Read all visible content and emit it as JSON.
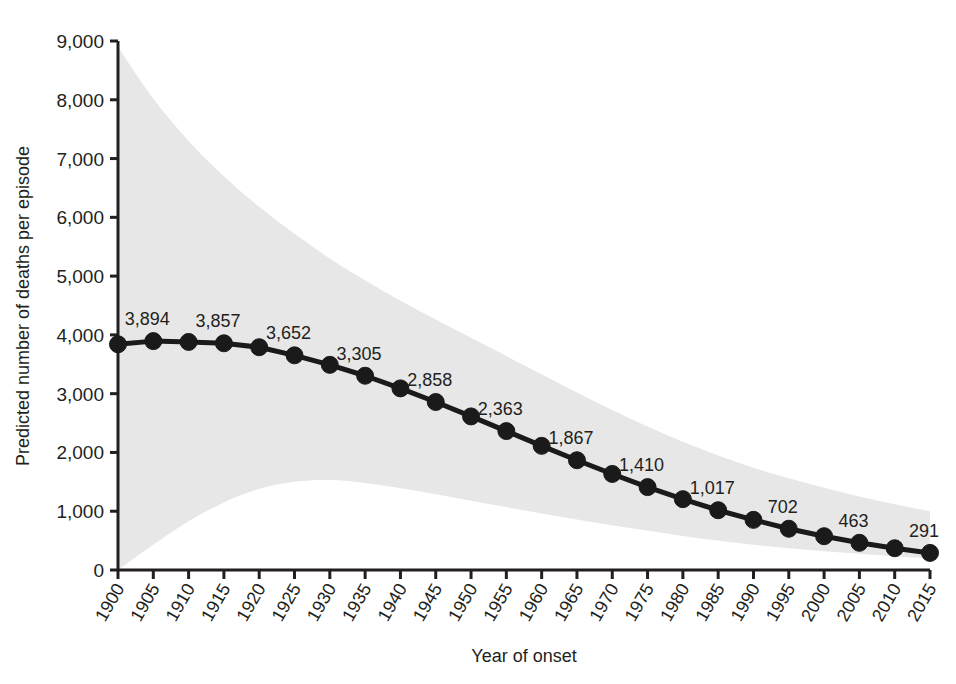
{
  "chart_data": {
    "type": "line",
    "title": "",
    "subtitle": "",
    "xlabel": "Year of onset",
    "ylabel": "Predicted number of deaths per episode",
    "xlim": [
      1900,
      2015
    ],
    "ylim": [
      0,
      9000
    ],
    "grid": false,
    "legend": "none",
    "x_tick_labels": [
      "1900",
      "1905",
      "1910",
      "1915",
      "1920",
      "1925",
      "1930",
      "1935",
      "1940",
      "1945",
      "1950",
      "1955",
      "1960",
      "1965",
      "1970",
      "1975",
      "1980",
      "1985",
      "1990",
      "1995",
      "2000",
      "2005",
      "2010",
      "2015"
    ],
    "y_tick_labels": [
      "0",
      "1,000",
      "2,000",
      "3,000",
      "4,000",
      "5,000",
      "6,000",
      "7,000",
      "8,000",
      "9,000"
    ],
    "y_tick_values": [
      0,
      1000,
      2000,
      3000,
      4000,
      5000,
      6000,
      7000,
      8000,
      9000
    ],
    "x": [
      1900,
      1905,
      1910,
      1915,
      1920,
      1925,
      1930,
      1935,
      1940,
      1945,
      1950,
      1955,
      1960,
      1965,
      1970,
      1975,
      1980,
      1985,
      1990,
      1995,
      2000,
      2005,
      2010,
      2015
    ],
    "series": [
      {
        "name": "Predicted deaths per episode",
        "marker": "circle",
        "color": "#1a1a1a",
        "values": [
          3840,
          3894,
          3880,
          3857,
          3790,
          3652,
          3490,
          3305,
          3090,
          2858,
          2613,
          2363,
          2112,
          1867,
          1634,
          1410,
          1205,
          1017,
          853,
          702,
          575,
          463,
          370,
          291
        ]
      }
    ],
    "data_labels": [
      {
        "x": 1905,
        "value": 3894,
        "text": "3,894"
      },
      {
        "x": 1915,
        "value": 3857,
        "text": "3,857"
      },
      {
        "x": 1925,
        "value": 3652,
        "text": "3,652"
      },
      {
        "x": 1935,
        "value": 3305,
        "text": "3,305"
      },
      {
        "x": 1945,
        "value": 2858,
        "text": "2,858"
      },
      {
        "x": 1955,
        "value": 2363,
        "text": "2,363"
      },
      {
        "x": 1965,
        "value": 1867,
        "text": "1,867"
      },
      {
        "x": 1975,
        "value": 1410,
        "text": "1,410"
      },
      {
        "x": 1985,
        "value": 1017,
        "text": "1,017"
      },
      {
        "x": 1995,
        "value": 702,
        "text": "702"
      },
      {
        "x": 2005,
        "value": 463,
        "text": "463"
      },
      {
        "x": 2015,
        "value": 291,
        "text": "291"
      }
    ],
    "confidence_band": {
      "name": "95% prediction interval",
      "fill_color": "#e7e7e7",
      "upper": [
        8900,
        8020,
        7300,
        6700,
        6180,
        5720,
        5300,
        4930,
        4580,
        4260,
        3950,
        3640,
        3330,
        3020,
        2720,
        2440,
        2180,
        1950,
        1740,
        1560,
        1400,
        1250,
        1120,
        1000
      ],
      "lower": [
        0,
        430,
        830,
        1150,
        1380,
        1500,
        1530,
        1480,
        1390,
        1290,
        1180,
        1070,
        960,
        860,
        760,
        670,
        580,
        500,
        430,
        370,
        320,
        275,
        235,
        200
      ]
    },
    "colors": {
      "line": "#1a1a1a",
      "marker": "#1a1a1a",
      "band": "#e7e7e7",
      "axis": "#231f20",
      "text": "#231f20",
      "background": "#ffffff"
    }
  }
}
